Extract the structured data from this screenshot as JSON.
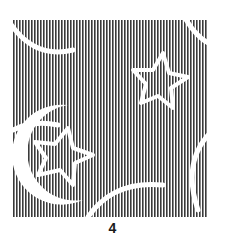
{
  "figure": {
    "label": "4",
    "pattern": {
      "description": "vertical stripe fabric swatch with crescent moons and stars",
      "motifs": [
        "crescent-moon",
        "star",
        "crescent-moon",
        "star",
        "crescent-moon",
        "crescent-moon"
      ],
      "stripe_color": "#3a3a3a",
      "background_color": "#ffffff"
    }
  }
}
